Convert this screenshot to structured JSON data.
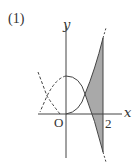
{
  "problem": {
    "label": "(1)"
  },
  "axes": {
    "x_label": "x",
    "y_label": "y",
    "origin_label": "O",
    "tick_label": "2"
  },
  "figure": {
    "colors": {
      "shade": "#a9a9a9",
      "stroke": "#444444"
    }
  }
}
